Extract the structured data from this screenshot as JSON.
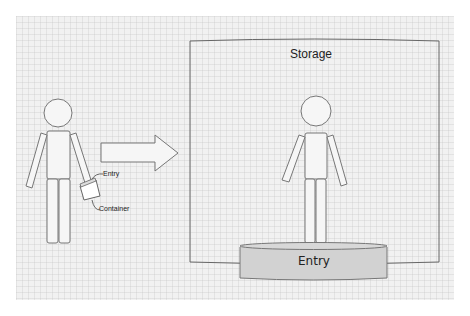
{
  "diagram": {
    "storage": {
      "title": "Storage"
    },
    "entry_cylinder": {
      "label": "Entry",
      "fill": "#d2d2d2"
    },
    "left_figure": {
      "callouts": [
        {
          "label": "Entry"
        },
        {
          "label": "Container"
        }
      ]
    },
    "arrow": {
      "direction": "right"
    },
    "colors": {
      "canvas": "#f1f1f1",
      "stroke": "#777777",
      "entry_fill": "#d2d2d2"
    }
  }
}
